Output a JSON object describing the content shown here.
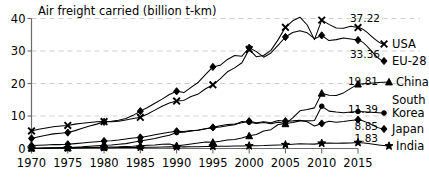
{
  "chart_data": {
    "type": "line",
    "title": "Air freight carried (billion t-km)",
    "xlabel": "",
    "ylabel": "",
    "xlim": [
      1970,
      2015
    ],
    "ylim": [
      0,
      40
    ],
    "grid": true,
    "legend": "right-inline-labels",
    "x_ticks": [
      "1970",
      "1975",
      "1980",
      "1985",
      "1990",
      "1995",
      "2000",
      "2005",
      "2010",
      "2015"
    ],
    "y_ticks": [
      "0",
      "10",
      "20",
      "30",
      "40"
    ],
    "x": [
      1970,
      1971,
      1972,
      1973,
      1974,
      1975,
      1976,
      1977,
      1978,
      1979,
      1980,
      1981,
      1982,
      1983,
      1984,
      1985,
      1986,
      1987,
      1988,
      1989,
      1990,
      1991,
      1992,
      1993,
      1994,
      1995,
      1996,
      1997,
      1998,
      1999,
      2000,
      2001,
      2002,
      2003,
      2004,
      2005,
      2006,
      2007,
      2008,
      2009,
      2010,
      2011,
      2012,
      2013,
      2014,
      2015
    ],
    "series": [
      {
        "name": "USA",
        "marker": "cross",
        "end_value": 37.22,
        "end_label": "37.22",
        "values": [
          5.4,
          5.9,
          6.3,
          6.7,
          6.9,
          7.1,
          7.5,
          7.8,
          8.0,
          8.2,
          8.3,
          8.2,
          8.4,
          8.8,
          9.2,
          9.6,
          10.6,
          11.8,
          13.0,
          14.0,
          14.6,
          14.8,
          16.0,
          16.8,
          18.4,
          19.6,
          21.4,
          23.6,
          24.8,
          26.4,
          30.5,
          28.2,
          28.6,
          30.2,
          33.5,
          37.3,
          39.3,
          40.4,
          38.0,
          33.5,
          39.5,
          38.2,
          37.1,
          37.0,
          37.6,
          37.22
        ]
      },
      {
        "name": "EU-28",
        "marker": "diamond",
        "end_value": 33.36,
        "end_label": "33.36",
        "values": [
          3.1,
          3.6,
          4.1,
          4.5,
          4.7,
          4.9,
          5.5,
          6.2,
          6.9,
          7.5,
          8.2,
          8.4,
          8.7,
          9.2,
          10.2,
          11.5,
          12.6,
          13.9,
          15.2,
          16.6,
          17.6,
          17.2,
          18.8,
          20.4,
          22.8,
          25.1,
          25.6,
          27.4,
          28.6,
          28.4,
          31.0,
          29.8,
          28.1,
          29.4,
          31.8,
          34.3,
          35.7,
          36.2,
          35.6,
          33.8,
          34.8,
          33.2,
          33.5,
          34.0,
          33.7,
          33.36
        ]
      },
      {
        "name": "China",
        "marker": "triangle",
        "end_value": 19.81,
        "end_label": "19.81",
        "values": [
          0.1,
          0.1,
          0.1,
          0.15,
          0.2,
          0.2,
          0.2,
          0.25,
          0.3,
          0.35,
          0.4,
          0.45,
          0.5,
          0.6,
          0.7,
          0.85,
          1.0,
          1.1,
          1.3,
          1.4,
          0.85,
          1.1,
          1.4,
          1.7,
          2.0,
          1.9,
          2.2,
          2.6,
          2.8,
          3.2,
          3.9,
          4.3,
          5.4,
          5.8,
          7.4,
          7.6,
          9.4,
          11.6,
          12.0,
          12.5,
          17.0,
          16.4,
          16.3,
          17.1,
          18.5,
          19.81
        ]
      },
      {
        "name": "South Korea",
        "marker": "circle",
        "end_value": 11.39,
        "end_label": "11.39",
        "values": [
          0.05,
          0.1,
          0.15,
          0.2,
          0.25,
          0.3,
          0.4,
          0.5,
          0.7,
          0.85,
          1.0,
          1.1,
          1.3,
          1.5,
          1.9,
          2.3,
          2.7,
          3.1,
          3.6,
          4.1,
          4.9,
          5.0,
          5.4,
          5.7,
          6.1,
          6.4,
          6.6,
          7.0,
          7.3,
          8.3,
          8.1,
          7.7,
          8.0,
          7.6,
          8.1,
          7.7,
          8.0,
          8.5,
          8.5,
          8.6,
          13.0,
          11.5,
          11.2,
          11.0,
          11.2,
          11.39
        ]
      },
      {
        "name": "Japan",
        "marker": "diamond",
        "end_value": 8.85,
        "end_label": "8.85",
        "values": [
          0.9,
          1.0,
          1.1,
          1.2,
          1.2,
          1.3,
          1.5,
          1.7,
          1.9,
          2.1,
          2.3,
          2.4,
          2.6,
          2.9,
          3.2,
          3.4,
          3.8,
          4.2,
          4.6,
          5.0,
          5.3,
          5.2,
          5.5,
          5.6,
          6.1,
          6.5,
          7.0,
          7.4,
          7.5,
          7.9,
          8.4,
          7.9,
          8.2,
          7.9,
          8.6,
          8.4,
          8.5,
          8.7,
          8.2,
          6.9,
          7.7,
          8.4,
          8.1,
          8.3,
          8.6,
          8.85
        ]
      },
      {
        "name": "India",
        "marker": "star",
        "end_value": 1.83,
        "end_label": "1.83",
        "values": [
          0.1,
          0.1,
          0.12,
          0.14,
          0.15,
          0.16,
          0.18,
          0.2,
          0.22,
          0.24,
          0.25,
          0.26,
          0.28,
          0.3,
          0.32,
          0.35,
          0.38,
          0.4,
          0.45,
          0.5,
          0.52,
          0.5,
          0.52,
          0.55,
          0.6,
          0.65,
          0.7,
          0.72,
          0.75,
          0.78,
          0.82,
          0.85,
          0.9,
          1.0,
          1.1,
          1.15,
          1.3,
          1.45,
          1.4,
          1.35,
          1.6,
          1.65,
          1.6,
          1.65,
          1.72,
          1.83
        ]
      }
    ]
  },
  "colors": {
    "line": "#000000",
    "grid": "#c8c8c8",
    "axis": "#6b6b6b",
    "background": "#ffffff",
    "text": "#000000"
  }
}
